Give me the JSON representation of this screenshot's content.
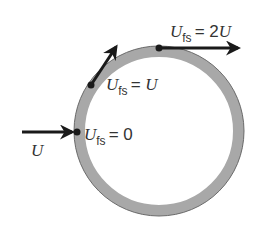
{
  "diagram": {
    "colors": {
      "ring": "#a8a8a8",
      "ring_edge": "#6a6a6a",
      "arrow": "#1a1a1a",
      "text": "#333333"
    },
    "incoming_flow": {
      "symbol": "U"
    },
    "labels": [
      {
        "id": "stagnation",
        "var": "U",
        "sub": "fs",
        "eq": "= 0"
      },
      {
        "id": "mid",
        "var": "U",
        "sub": "fs",
        "eq": "= ",
        "rhs_var": "U"
      },
      {
        "id": "top",
        "var": "U",
        "sub": "fs",
        "eq": "= 2",
        "rhs_var": "U"
      }
    ]
  }
}
